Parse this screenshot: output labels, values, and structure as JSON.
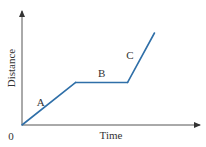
{
  "chart_data": {
    "type": "line",
    "title": "",
    "xlabel": "Time",
    "ylabel": "Distance",
    "origin_label": "0",
    "xlim": [
      0,
      1
    ],
    "ylim": [
      0,
      1
    ],
    "grid": false,
    "legend": "none",
    "line_color": "#2f6fa8",
    "axis_color": "#555555",
    "series": [
      {
        "name": "distance-time",
        "x": [
          0,
          0.3,
          0.59,
          0.74
        ],
        "y": [
          0,
          0.37,
          0.37,
          0.8
        ]
      }
    ],
    "annotations": [
      {
        "text": "A",
        "segment": 0
      },
      {
        "text": "B",
        "segment": 1
      },
      {
        "text": "C",
        "segment": 2
      }
    ]
  }
}
